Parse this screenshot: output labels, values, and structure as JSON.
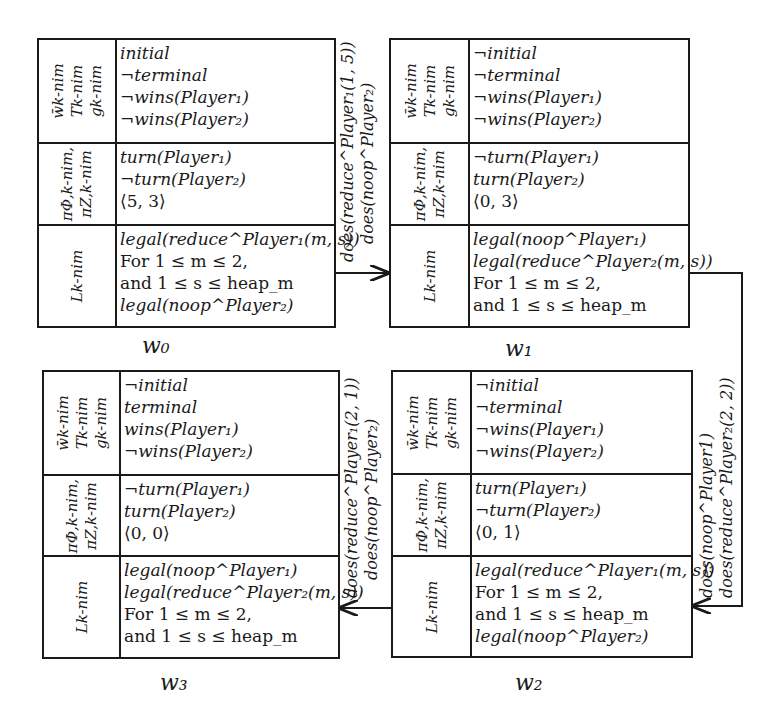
{
  "diagram": {
    "row_labels": {
      "row1": [
        "w̄k-nim",
        "Tk-nim",
        "gk-nim"
      ],
      "row2": [
        "πΦ,k-nim,",
        "πZ,k-nim"
      ],
      "row3": [
        "Lk-nim"
      ]
    },
    "states": [
      {
        "id": "w0",
        "label": "w₀",
        "row1": [
          "initial",
          "¬terminal",
          "¬wins(Player₁)",
          "¬wins(Player₂)"
        ],
        "row2": [
          "turn(Player₁)",
          "¬turn(Player₂)",
          "⟨5, 3⟩"
        ],
        "row3": [
          "legal(reduce^Player₁(m, s))",
          "For 1 ≤ m  ≤ 2,",
          "and 1  ≤ s  ≤ heap_m",
          "legal(noop^Player₂)"
        ]
      },
      {
        "id": "w1",
        "label": "w₁",
        "row1": [
          "¬initial",
          "¬terminal",
          "¬wins(Player₁)",
          "¬wins(Player₂)"
        ],
        "row2": [
          "¬turn(Player₁)",
          "turn(Player₂)",
          "⟨0, 3⟩"
        ],
        "row3": [
          "legal(noop^Player₁)",
          "legal(reduce^Player₂(m, s))",
          "For 1 ≤ m  ≤ 2,",
          "and 1  ≤ s  ≤ heap_m"
        ]
      },
      {
        "id": "w2",
        "label": "w₂",
        "row1": [
          "¬initial",
          "¬terminal",
          "¬wins(Player₁)",
          "¬wins(Player₂)"
        ],
        "row2": [
          "turn(Player₁)",
          "¬turn(Player₂)",
          "⟨0, 1⟩"
        ],
        "row3": [
          "legal(reduce^Player₁(m, s))",
          "For 1 ≤ m  ≤ 2,",
          "and 1  ≤ s  ≤ heap_m",
          "legal(noop^Player₂)"
        ]
      },
      {
        "id": "w3",
        "label": "w₃",
        "row1": [
          "¬initial",
          "terminal",
          "wins(Player₁)",
          "¬wins(Player₂)"
        ],
        "row2": [
          "¬turn(Player₁)",
          "turn(Player₂)",
          "⟨0, 0⟩"
        ],
        "row3": [
          "legal(noop^Player₁)",
          "legal(reduce^Player₂(m, s))",
          "For 1 ≤ m  ≤ 2,",
          "and 1  ≤ s  ≤ heap_m"
        ]
      }
    ],
    "transitions": [
      {
        "from": "w0",
        "to": "w1",
        "label": [
          "does(reduce^Player₁(1, 5))",
          "does(noop^Player₂)"
        ]
      },
      {
        "from": "w1",
        "to": "w2",
        "label": [
          "does(noop^Player1)",
          "does(reduce^Player₂(2, 2))"
        ]
      },
      {
        "from": "w2",
        "to": "w3",
        "label": [
          "does(reduce^Player₁(2, 1))",
          "does(noop^Player₂)"
        ]
      }
    ]
  }
}
